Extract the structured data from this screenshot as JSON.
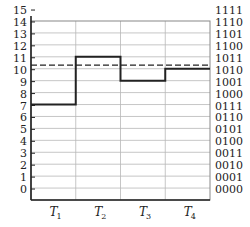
{
  "chart_data": {
    "type": "line",
    "subtype": "step",
    "title": "",
    "xlabel": "",
    "ylabel": "",
    "categories": [
      "T1",
      "T2",
      "T3",
      "T4"
    ],
    "category_labels": [
      {
        "main": "T",
        "sub": "1"
      },
      {
        "main": "T",
        "sub": "2"
      },
      {
        "main": "T",
        "sub": "3"
      },
      {
        "main": "T",
        "sub": "4"
      }
    ],
    "series": [
      {
        "name": "quantized level",
        "values": [
          7.5,
          11.5,
          9.5,
          10.5
        ],
        "style": "solid"
      }
    ],
    "reference_line": {
      "value": 10.8,
      "style": "dashed"
    },
    "ylim": [
      -0.5,
      14.5
    ],
    "left_ticks": [
      "0",
      "1",
      "2",
      "3",
      "4",
      "5",
      "6",
      "7",
      "8",
      "9",
      "10",
      "11",
      "12",
      "13",
      "14",
      "15"
    ],
    "right_ticks": [
      "0000",
      "0001",
      "0010",
      "0011",
      "0100",
      "0101",
      "0110",
      "0111",
      "1000",
      "1001",
      "1010",
      "1011",
      "1100",
      "1101",
      "1110",
      "1111"
    ],
    "grid": true,
    "colors": {
      "line": "#222222",
      "grid": "#b8b8b8",
      "axis": "#222222"
    }
  }
}
